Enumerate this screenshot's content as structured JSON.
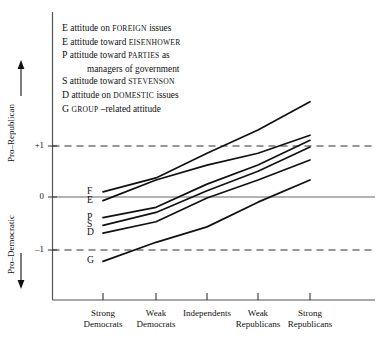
{
  "chart_data": {
    "type": "line",
    "title": "",
    "xlabel": "",
    "ylabel": "Pro-Republican / Pro-Democratic",
    "categories": [
      "Strong Democrats",
      "Weak Democrats",
      "Independents",
      "Weak Republicans",
      "Strong Republicans"
    ],
    "ylim": [
      -1.6,
      2.4
    ],
    "yticks": [
      1,
      0,
      -1
    ],
    "ytick_labels": [
      "+1",
      "0",
      "-1"
    ],
    "gridlines": {
      "solid_at": [
        0
      ],
      "dashed_at": [
        1,
        -1
      ]
    },
    "legend_position": "top-left-inside",
    "series": [
      {
        "name": "F",
        "label": "attitude on FOREIGN issues",
        "values": [
          0.1,
          0.37,
          0.85,
          1.3,
          1.85
        ]
      },
      {
        "name": "E",
        "label": "attitude toward EISENHOWER",
        "values": [
          -0.07,
          0.33,
          0.62,
          0.85,
          1.2
        ]
      },
      {
        "name": "P",
        "label": "attitude toward PARTIES as managers of government",
        "values": [
          -0.4,
          -0.2,
          0.25,
          0.62,
          1.1
        ]
      },
      {
        "name": "S",
        "label": "attitude toward STEVENSON",
        "values": [
          -0.55,
          -0.3,
          0.12,
          0.5,
          0.97
        ]
      },
      {
        "name": "D",
        "label": "attitude on DOMESTIC issues",
        "values": [
          -0.7,
          -0.48,
          -0.02,
          0.33,
          0.72
        ]
      },
      {
        "name": "G",
        "label": "GROUP-related attitude",
        "values": [
          -1.25,
          -0.88,
          -0.58,
          -0.1,
          0.33
        ]
      }
    ]
  },
  "legend": {
    "items": [
      {
        "key": "E",
        "pre": "attitude on",
        "caps": "FOREIGN",
        "post": "issues",
        "cont": ""
      },
      {
        "key": "E",
        "pre": "attitude toward",
        "caps": "EISENHOWER",
        "post": "",
        "cont": ""
      },
      {
        "key": "P",
        "pre": "attitude toward",
        "caps": "PARTIES",
        "post": "as",
        "cont": "managers of government"
      },
      {
        "key": "S",
        "pre": "attitude toward",
        "caps": "STEVENSON",
        "post": "",
        "cont": ""
      },
      {
        "key": "D",
        "pre": "attitude on",
        "caps": "DOMESTIC",
        "post": "issues",
        "cont": ""
      },
      {
        "key": "G",
        "pre": "",
        "caps": "GROUP",
        "post": "–related attitude",
        "cont": ""
      }
    ]
  },
  "axes": {
    "y_top_label": "Pro–Republican",
    "y_bottom_label": "Pro–Democratic",
    "y_tick_plus_one": "+1",
    "y_tick_zero": "0",
    "y_tick_minus_one": "–1"
  },
  "xaxis": {
    "categories": [
      {
        "line1": "Strong",
        "line2": "Democrats"
      },
      {
        "line1": "Weak",
        "line2": "Democrats"
      },
      {
        "line1": "Independents",
        "line2": ""
      },
      {
        "line1": "Weak",
        "line2": "Republicans"
      },
      {
        "line1": "Strong",
        "line2": "Republicans"
      }
    ]
  },
  "series_labels": [
    {
      "name": "F"
    },
    {
      "name": "E"
    },
    {
      "name": "P"
    },
    {
      "name": "S"
    },
    {
      "name": "D"
    },
    {
      "name": "G"
    }
  ],
  "colors": {
    "ink": "#111111",
    "axis": "#555555"
  }
}
